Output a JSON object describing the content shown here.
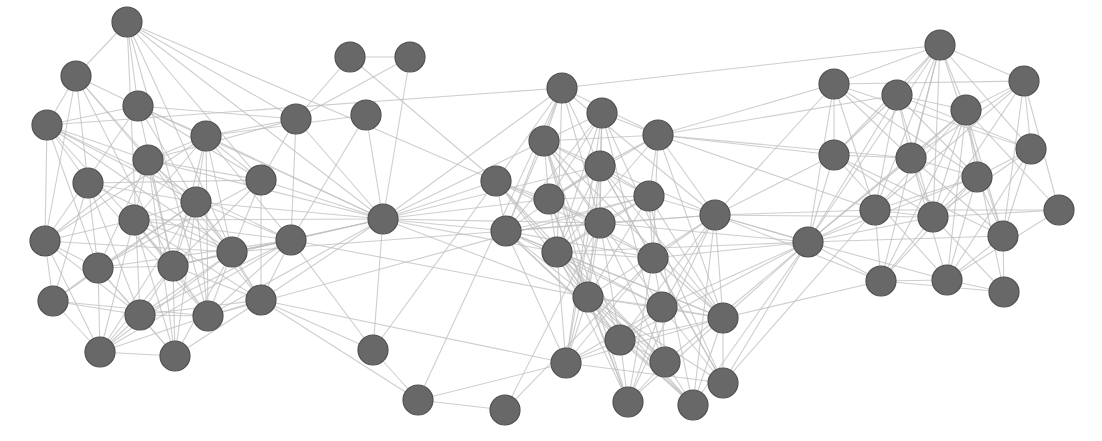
{
  "diagram": {
    "type": "network-graph",
    "node_radius": 15,
    "colors": {
      "node_fill": "#686868",
      "node_stroke": "#4f4f4f",
      "edge": "#bdbdbd",
      "background": "#ffffff"
    },
    "nodes": [
      {
        "id": 0,
        "x": 127,
        "y": 22,
        "group": "left"
      },
      {
        "id": 1,
        "x": 76,
        "y": 76,
        "group": "left"
      },
      {
        "id": 2,
        "x": 138,
        "y": 106,
        "group": "left"
      },
      {
        "id": 3,
        "x": 47,
        "y": 125,
        "group": "left"
      },
      {
        "id": 4,
        "x": 206,
        "y": 136,
        "group": "left"
      },
      {
        "id": 5,
        "x": 148,
        "y": 160,
        "group": "left"
      },
      {
        "id": 6,
        "x": 88,
        "y": 183,
        "group": "left"
      },
      {
        "id": 7,
        "x": 261,
        "y": 180,
        "group": "left"
      },
      {
        "id": 8,
        "x": 196,
        "y": 202,
        "group": "left"
      },
      {
        "id": 9,
        "x": 134,
        "y": 220,
        "group": "left"
      },
      {
        "id": 10,
        "x": 291,
        "y": 240,
        "group": "left"
      },
      {
        "id": 11,
        "x": 45,
        "y": 241,
        "group": "left"
      },
      {
        "id": 12,
        "x": 98,
        "y": 268,
        "group": "left"
      },
      {
        "id": 13,
        "x": 173,
        "y": 266,
        "group": "left"
      },
      {
        "id": 14,
        "x": 232,
        "y": 252,
        "group": "left"
      },
      {
        "id": 15,
        "x": 53,
        "y": 301,
        "group": "left"
      },
      {
        "id": 16,
        "x": 140,
        "y": 315,
        "group": "left"
      },
      {
        "id": 17,
        "x": 208,
        "y": 316,
        "group": "left"
      },
      {
        "id": 18,
        "x": 261,
        "y": 300,
        "group": "left"
      },
      {
        "id": 19,
        "x": 100,
        "y": 352,
        "group": "left"
      },
      {
        "id": 20,
        "x": 175,
        "y": 356,
        "group": "left"
      },
      {
        "id": 21,
        "x": 350,
        "y": 57,
        "group": "top"
      },
      {
        "id": 22,
        "x": 410,
        "y": 57,
        "group": "top"
      },
      {
        "id": 23,
        "x": 366,
        "y": 115,
        "group": "top"
      },
      {
        "id": 24,
        "x": 296,
        "y": 119,
        "group": "top"
      },
      {
        "id": 25,
        "x": 383,
        "y": 219,
        "group": "hub"
      },
      {
        "id": 26,
        "x": 373,
        "y": 350,
        "group": "bottom"
      },
      {
        "id": 27,
        "x": 418,
        "y": 400,
        "group": "bottom"
      },
      {
        "id": 28,
        "x": 505,
        "y": 410,
        "group": "bottom"
      },
      {
        "id": 29,
        "x": 562,
        "y": 88,
        "group": "center"
      },
      {
        "id": 30,
        "x": 602,
        "y": 113,
        "group": "center"
      },
      {
        "id": 31,
        "x": 544,
        "y": 141,
        "group": "center"
      },
      {
        "id": 32,
        "x": 600,
        "y": 166,
        "group": "center"
      },
      {
        "id": 33,
        "x": 658,
        "y": 135,
        "group": "center"
      },
      {
        "id": 34,
        "x": 496,
        "y": 181,
        "group": "center"
      },
      {
        "id": 35,
        "x": 549,
        "y": 199,
        "group": "center"
      },
      {
        "id": 36,
        "x": 649,
        "y": 196,
        "group": "center"
      },
      {
        "id": 37,
        "x": 600,
        "y": 223,
        "group": "center"
      },
      {
        "id": 38,
        "x": 506,
        "y": 231,
        "group": "center"
      },
      {
        "id": 39,
        "x": 715,
        "y": 215,
        "group": "center"
      },
      {
        "id": 40,
        "x": 557,
        "y": 252,
        "group": "center"
      },
      {
        "id": 41,
        "x": 653,
        "y": 258,
        "group": "center"
      },
      {
        "id": 42,
        "x": 588,
        "y": 297,
        "group": "center"
      },
      {
        "id": 43,
        "x": 662,
        "y": 307,
        "group": "center"
      },
      {
        "id": 44,
        "x": 723,
        "y": 318,
        "group": "center"
      },
      {
        "id": 45,
        "x": 620,
        "y": 340,
        "group": "center"
      },
      {
        "id": 46,
        "x": 665,
        "y": 362,
        "group": "center"
      },
      {
        "id": 47,
        "x": 566,
        "y": 363,
        "group": "center"
      },
      {
        "id": 48,
        "x": 723,
        "y": 383,
        "group": "center"
      },
      {
        "id": 49,
        "x": 628,
        "y": 402,
        "group": "center"
      },
      {
        "id": 50,
        "x": 693,
        "y": 405,
        "group": "center"
      },
      {
        "id": 51,
        "x": 808,
        "y": 242,
        "group": "hub"
      },
      {
        "id": 52,
        "x": 940,
        "y": 45,
        "group": "right"
      },
      {
        "id": 53,
        "x": 834,
        "y": 84,
        "group": "right"
      },
      {
        "id": 54,
        "x": 897,
        "y": 95,
        "group": "right"
      },
      {
        "id": 55,
        "x": 1024,
        "y": 81,
        "group": "right"
      },
      {
        "id": 56,
        "x": 966,
        "y": 110,
        "group": "right"
      },
      {
        "id": 57,
        "x": 834,
        "y": 155,
        "group": "right"
      },
      {
        "id": 58,
        "x": 911,
        "y": 158,
        "group": "right"
      },
      {
        "id": 59,
        "x": 977,
        "y": 177,
        "group": "right"
      },
      {
        "id": 60,
        "x": 1031,
        "y": 149,
        "group": "right"
      },
      {
        "id": 61,
        "x": 875,
        "y": 210,
        "group": "right"
      },
      {
        "id": 62,
        "x": 933,
        "y": 217,
        "group": "right"
      },
      {
        "id": 63,
        "x": 1059,
        "y": 210,
        "group": "right"
      },
      {
        "id": 64,
        "x": 1003,
        "y": 236,
        "group": "right"
      },
      {
        "id": 65,
        "x": 881,
        "y": 281,
        "group": "right"
      },
      {
        "id": 66,
        "x": 947,
        "y": 280,
        "group": "right"
      },
      {
        "id": 67,
        "x": 1004,
        "y": 292,
        "group": "right"
      }
    ],
    "bridge_edges": [
      [
        21,
        22
      ],
      [
        21,
        24
      ],
      [
        22,
        24
      ],
      [
        22,
        25
      ],
      [
        21,
        34
      ],
      [
        23,
        25
      ],
      [
        23,
        4
      ],
      [
        23,
        10
      ],
      [
        24,
        0
      ],
      [
        24,
        2
      ],
      [
        24,
        4
      ],
      [
        24,
        7
      ],
      [
        24,
        10
      ],
      [
        24,
        5
      ],
      [
        24,
        25
      ],
      [
        25,
        7
      ],
      [
        25,
        10
      ],
      [
        25,
        4
      ],
      [
        25,
        8
      ],
      [
        25,
        14
      ],
      [
        25,
        18
      ],
      [
        25,
        17
      ],
      [
        25,
        13
      ],
      [
        25,
        0
      ],
      [
        25,
        2
      ],
      [
        25,
        5
      ],
      [
        25,
        9
      ],
      [
        25,
        34
      ],
      [
        25,
        31
      ],
      [
        25,
        29
      ],
      [
        25,
        35
      ],
      [
        25,
        38
      ],
      [
        25,
        37
      ],
      [
        25,
        40
      ],
      [
        25,
        32
      ],
      [
        25,
        42
      ],
      [
        26,
        25
      ],
      [
        26,
        27
      ],
      [
        26,
        34
      ],
      [
        26,
        18
      ],
      [
        26,
        10
      ],
      [
        27,
        28
      ],
      [
        27,
        29
      ],
      [
        27,
        18
      ],
      [
        27,
        47
      ],
      [
        28,
        37
      ],
      [
        28,
        41
      ],
      [
        18,
        47
      ],
      [
        10,
        42
      ],
      [
        14,
        38
      ],
      [
        17,
        36
      ],
      [
        3,
        29
      ],
      [
        0,
        34
      ],
      [
        33,
        53
      ],
      [
        33,
        57
      ],
      [
        33,
        61
      ],
      [
        33,
        54
      ],
      [
        33,
        58
      ],
      [
        39,
        51
      ],
      [
        39,
        53
      ],
      [
        39,
        57
      ],
      [
        39,
        61
      ],
      [
        39,
        62
      ],
      [
        39,
        65
      ],
      [
        51,
        53
      ],
      [
        51,
        54
      ],
      [
        51,
        57
      ],
      [
        51,
        58
      ],
      [
        51,
        61
      ],
      [
        51,
        62
      ],
      [
        51,
        65
      ],
      [
        51,
        66
      ],
      [
        51,
        59
      ],
      [
        51,
        56
      ],
      [
        51,
        64
      ],
      [
        51,
        52
      ],
      [
        51,
        36
      ],
      [
        51,
        41
      ],
      [
        51,
        43
      ],
      [
        51,
        44
      ],
      [
        51,
        46
      ],
      [
        51,
        48
      ],
      [
        51,
        37
      ],
      [
        51,
        40
      ],
      [
        51,
        45
      ],
      [
        51,
        50
      ],
      [
        44,
        65
      ],
      [
        48,
        61
      ],
      [
        29,
        52
      ]
    ]
  }
}
